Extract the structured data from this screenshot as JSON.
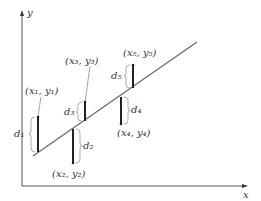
{
  "diagram": {
    "axes": {
      "x_label": "x",
      "y_label": "y"
    },
    "colors": {
      "axis": "#555555",
      "line": "#666666",
      "bar": "#222222",
      "brace": "#888888",
      "text": "#333333"
    },
    "points": [
      {
        "label": "(x₁, y₁)",
        "deviation": "d₁",
        "position": "above line"
      },
      {
        "label": "(x₂, y₂)",
        "deviation": "d₂",
        "position": "below line"
      },
      {
        "label": "(x₃, y₃)",
        "deviation": "d₃",
        "position": "above line"
      },
      {
        "label": "(x₄, y₄)",
        "deviation": "d₄",
        "position": "below line"
      },
      {
        "label": "(x₅, y₅)",
        "deviation": "d₅",
        "position": "above line"
      }
    ]
  }
}
